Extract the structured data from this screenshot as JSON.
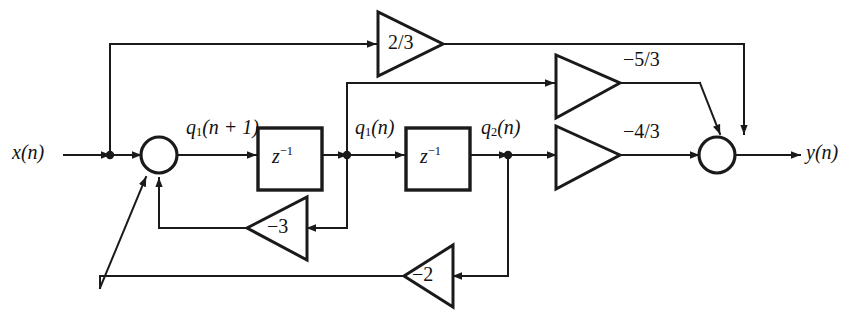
{
  "diagram": {
    "signals": {
      "input": "x(n)",
      "output": "y(n)",
      "state_next": "q1(n + 1)",
      "state1": "q1(n)",
      "state2": "q2(n)"
    },
    "labels": {
      "input": "x(n)",
      "output": "y(n)",
      "q1_next_base": "q",
      "q1_next_sub": "1",
      "q1_next_rest": "(n + 1)",
      "q1_base": "q",
      "q1_sub": "1",
      "q1_rest": "(n)",
      "q2_base": "q",
      "q2_sub": "2",
      "q2_rest": "(n)",
      "delay_base": "z",
      "delay_exp": "−1"
    },
    "gains": {
      "feedforward_direct": "2/3",
      "from_q1": "−5/3",
      "from_q2": "−4/3",
      "feedback_q1": "−3",
      "feedback_q2": "−2"
    },
    "blocks": [
      {
        "name": "delay-1",
        "label_base": "z",
        "label_exp": "−1"
      },
      {
        "name": "delay-2",
        "label_base": "z",
        "label_exp": "−1"
      }
    ],
    "nodes": [
      {
        "name": "input-sum-node",
        "kind": "summing-junction"
      },
      {
        "name": "output-sum-node",
        "kind": "summing-junction"
      },
      {
        "name": "input-tap",
        "kind": "branch-dot"
      },
      {
        "name": "q1-tap",
        "kind": "branch-dot"
      },
      {
        "name": "q2-tap",
        "kind": "branch-dot"
      }
    ],
    "colors": {
      "line": "#1a1a1a",
      "background": "#ffffff",
      "text": "#111111"
    }
  }
}
